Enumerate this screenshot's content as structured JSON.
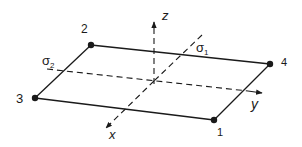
{
  "diagram": {
    "colors": {
      "ink": "#1a1a1a",
      "background": "#ffffff"
    },
    "nodes": [
      {
        "id": "1",
        "label": "1"
      },
      {
        "id": "2",
        "label": "2"
      },
      {
        "id": "3",
        "label": "3"
      },
      {
        "id": "4",
        "label": "4"
      }
    ],
    "axes": {
      "x": {
        "label": "x"
      },
      "y": {
        "label": "y"
      },
      "z": {
        "label": "z"
      }
    },
    "stresses": {
      "sigma1": {
        "symbol": "σ",
        "subscript": "1"
      },
      "sigma2": {
        "symbol": "σ",
        "subscript": "2"
      }
    }
  }
}
